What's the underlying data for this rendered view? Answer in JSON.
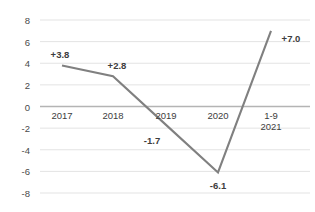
{
  "chart_data": {
    "type": "line",
    "title": "",
    "subtitle": "",
    "xlabel": "",
    "ylabel": "",
    "categories": [
      "2017",
      "2018",
      "2019",
      "2020",
      "1-9 2021"
    ],
    "category_lines": [
      [
        "2017"
      ],
      [
        "2018"
      ],
      [
        "2019"
      ],
      [
        "2020"
      ],
      [
        "1-9",
        "2021"
      ]
    ],
    "values": [
      3.8,
      2.8,
      -1.7,
      -6.1,
      7.0
    ],
    "point_labels": [
      "+3.8",
      "+2.8",
      "-1.7",
      "-6.1",
      "+7.0"
    ],
    "ylim": [
      -8,
      8
    ],
    "ytick_labels": [
      "8",
      "6",
      "4",
      "2",
      "0",
      "-2",
      "-4",
      "-6",
      "-8"
    ],
    "ytick_values": [
      8,
      6,
      4,
      2,
      0,
      -2,
      -4,
      -6,
      -8
    ],
    "grid": true,
    "legend": false,
    "legend_position": "none",
    "series_color": "#808080",
    "grid_color": "#e3e3e3",
    "zero_line_color": "#b4b4b4",
    "background_color": "#ffffff",
    "markers": false
  }
}
